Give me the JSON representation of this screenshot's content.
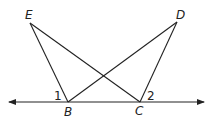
{
  "diagram": {
    "points": {
      "E": {
        "label": "E",
        "x": 30,
        "y": 23
      },
      "D": {
        "label": "D",
        "x": 177,
        "y": 22
      },
      "B": {
        "label": "B",
        "x": 68,
        "y": 102
      },
      "C": {
        "label": "C",
        "x": 140,
        "y": 102
      }
    },
    "angles": [
      {
        "label": "1",
        "at": "B"
      },
      {
        "label": "2",
        "at": "C"
      }
    ],
    "segments": [
      "EB",
      "EC",
      "DB",
      "DC"
    ],
    "line": {
      "through": [
        "B",
        "C"
      ],
      "arrows": "both"
    },
    "colors": {
      "stroke": "#222222",
      "background": "#ffffff"
    }
  }
}
